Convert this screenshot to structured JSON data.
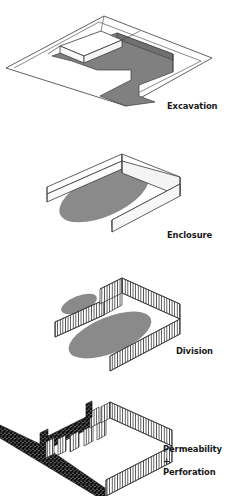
{
  "figure": {
    "kind": "architectural-isometric-diagram-series",
    "background": "#ffffff",
    "ink": "#1a1a1a",
    "panel_count": 4
  },
  "palette": {
    "outline": "#3a3a3a",
    "ground_fill": "#ffffff",
    "excavation_gray": "#808080",
    "ellipse_gray": "#8a8a8a",
    "wall_face": "#f2f2f2",
    "wall_top": "#ffffff",
    "hatch_line": "#2b2b2b",
    "speckle_dark": "#111111",
    "caption_color": "#1a1a1a"
  },
  "panels": [
    {
      "id": "excavation",
      "caption": "Excavation",
      "description": "Isometric ground plane with a U-shaped recessed gray cut and a sloped ramp volume.",
      "fill": "#808080"
    },
    {
      "id": "enclosure",
      "caption": "Enclosure",
      "description": "U-shaped solid white wall enclosing a gray elliptical ground area.",
      "fill": "#8a8a8a"
    },
    {
      "id": "division",
      "caption": "Division",
      "description": "U-shaped colonnade of vertical hatched posts with an inner dividing wall separating a small and a large gray ellipse.",
      "fill": "#8a8a8a"
    },
    {
      "id": "permeability-perforation",
      "caption": "Permeability +\nPerforation",
      "description": "Fragmented colonnade with gaps, dark speckled wall segments and a heavy dark diagonal bar.",
      "fill": "#111111"
    }
  ]
}
